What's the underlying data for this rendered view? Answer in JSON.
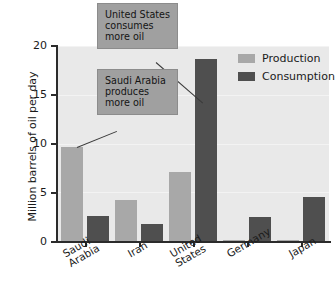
{
  "chart_data": {
    "type": "bar",
    "title": "",
    "xlabel": "",
    "ylabel": "Million barrels of oil per day",
    "ylim": [
      0,
      20
    ],
    "yticks": [
      0,
      5,
      10,
      15,
      20
    ],
    "ytick_labels": [
      "0",
      "5",
      "10",
      "15",
      "20"
    ],
    "grid": true,
    "legend_position": "top-right",
    "categories": [
      "Saudi Arabia",
      "Iran",
      "United States",
      "Germany",
      "Japan"
    ],
    "series": [
      {
        "name": "Production",
        "color": "#a8a8a8",
        "values": [
          9.6,
          4.2,
          7.1,
          0.15,
          0.1
        ]
      },
      {
        "name": "Consumption",
        "color": "#4f4f4f",
        "values": [
          2.55,
          1.7,
          18.7,
          2.5,
          4.5
        ]
      }
    ],
    "annotations": [
      {
        "id": "callout-us",
        "text": "United States consumes more oil",
        "points_to": "United States Consumption"
      },
      {
        "id": "callout-sa",
        "text": "Saudi Arabia produces more oil",
        "points_to": "Saudi Arabia Production"
      }
    ]
  },
  "axis": {
    "y_title": "Million barrels of oil per day",
    "tick_0": "0",
    "tick_5": "5",
    "tick_10": "10",
    "tick_15": "15",
    "tick_20": "20"
  },
  "legend": {
    "production_label": "Production",
    "consumption_label": "Consumption"
  },
  "callouts": {
    "us_line1": "United States",
    "us_line2": "consumes",
    "us_line3": "more oil",
    "sa_line1": "Saudi Arabia",
    "sa_line2": "produces",
    "sa_line3": "more oil"
  },
  "xlabels": {
    "saudi_l1": "Saudi",
    "saudi_l2": "Arabia",
    "iran": "Iran",
    "us_l1": "United",
    "us_l2": "States",
    "germany": "Germany",
    "japan": "Japan"
  },
  "colors": {
    "production": "#a8a8a8",
    "consumption": "#4f4f4f",
    "plot_background": "#e9e9e9",
    "callout_background": "#a0a0a0",
    "axis": "#2b2b2b"
  }
}
